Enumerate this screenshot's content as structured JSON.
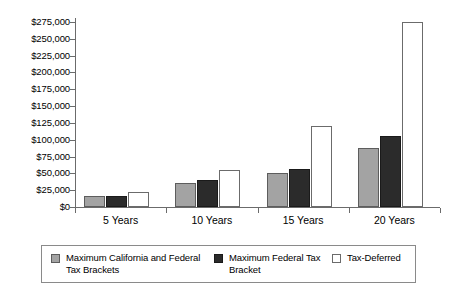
{
  "chart_data": {
    "type": "bar",
    "title": "",
    "subtitle": "",
    "xlabel": "",
    "ylabel": "",
    "categories": [
      "5 Years",
      "10 Years",
      "15 Years",
      "20 Years"
    ],
    "series": [
      {
        "name": "Maximum California and Federal Tax Brackets",
        "color": "#a3a3a3",
        "values": [
          17000,
          35000,
          50000,
          88000
        ]
      },
      {
        "name": "Maximum Federal Tax Bracket",
        "color": "#2b2b2b",
        "values": [
          17000,
          40000,
          57000,
          105000
        ]
      },
      {
        "name": "Tax-Deferred",
        "color": "#ffffff",
        "values": [
          22000,
          55000,
          120000,
          275000
        ]
      }
    ],
    "ylim": [
      0,
      275000
    ],
    "ytick_step": 25000,
    "ytick_labels": [
      "$0",
      "$25,000",
      "$50,000",
      "$75,000",
      "$100,000",
      "$125,000",
      "$150,000",
      "$175,000",
      "$200,000",
      "$225,000",
      "$250,000",
      "$275,000"
    ],
    "grid": false,
    "legend_position": "bottom",
    "legend": [
      "Maximum California and Federal Tax Brackets",
      "Maximum Federal Tax Bracket",
      "Tax-Deferred"
    ]
  }
}
